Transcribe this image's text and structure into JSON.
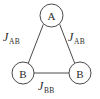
{
  "figure": {
    "type": "graph-diagram",
    "background_color": "#ffffff",
    "stroke_color": "#4a4a4a",
    "text_color": "#2b2b2b"
  },
  "nodes": [
    {
      "id": "A",
      "label": "A",
      "cx": 51.5,
      "cy": 15.5,
      "r": 11.5
    },
    {
      "id": "B1",
      "label": "B",
      "cx": 23.0,
      "cy": 73.0,
      "r": 11.0
    },
    {
      "id": "B2",
      "label": "B",
      "cx": 80.0,
      "cy": 73.0,
      "r": 11.0
    }
  ],
  "edges": [
    {
      "id": "A-B1",
      "from": "A",
      "to": "B1",
      "symbol": "J",
      "subscript": "AB",
      "x1": 43.2,
      "y1": 24.7,
      "x2": 28.3,
      "y2": 63.2
    },
    {
      "id": "A-B2",
      "from": "A",
      "to": "B2",
      "symbol": "J",
      "subscript": "AB",
      "x1": 59.8,
      "y1": 24.7,
      "x2": 74.7,
      "y2": 63.2
    },
    {
      "id": "B1-B2",
      "from": "B1",
      "to": "B2",
      "symbol": "J",
      "subscript": "BB",
      "x1": 34.0,
      "y1": 73.0,
      "x2": 69.0,
      "y2": 73.0
    }
  ]
}
